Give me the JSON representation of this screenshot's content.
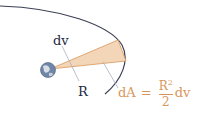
{
  "diagram": {
    "labels": {
      "dv": "dv",
      "R": "R"
    },
    "formula": {
      "lhs": "dA",
      "equals": "=",
      "numerator": "R",
      "exponent": "2",
      "denominator": "2",
      "tail": "dv"
    },
    "colors": {
      "orbit": "#3a3f55",
      "wedge_fill": "#f3d6b8",
      "wedge_stroke": "#d8975a",
      "formula": "#d8975a",
      "leader": "#aab0bb"
    }
  }
}
